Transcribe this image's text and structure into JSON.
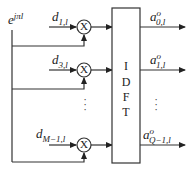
{
  "diagram": {
    "carrier": {
      "base": "e",
      "exponent": "jπl"
    },
    "inputs": [
      {
        "base": "d",
        "sub": "1,l"
      },
      {
        "base": "d",
        "sub": "3,l"
      },
      {
        "base": "d",
        "sub": "M−1,l"
      }
    ],
    "multiplier_symbol": "X",
    "block": {
      "letters": [
        "I",
        "D",
        "F",
        "T"
      ]
    },
    "outputs": [
      {
        "base": "a",
        "sup": "o",
        "sub": "0,l"
      },
      {
        "base": "a",
        "sup": "o",
        "sub": "1,l"
      },
      {
        "base": "a",
        "sup": "o",
        "sub": "Q−1,l"
      }
    ],
    "ellipsis": "⋮"
  }
}
